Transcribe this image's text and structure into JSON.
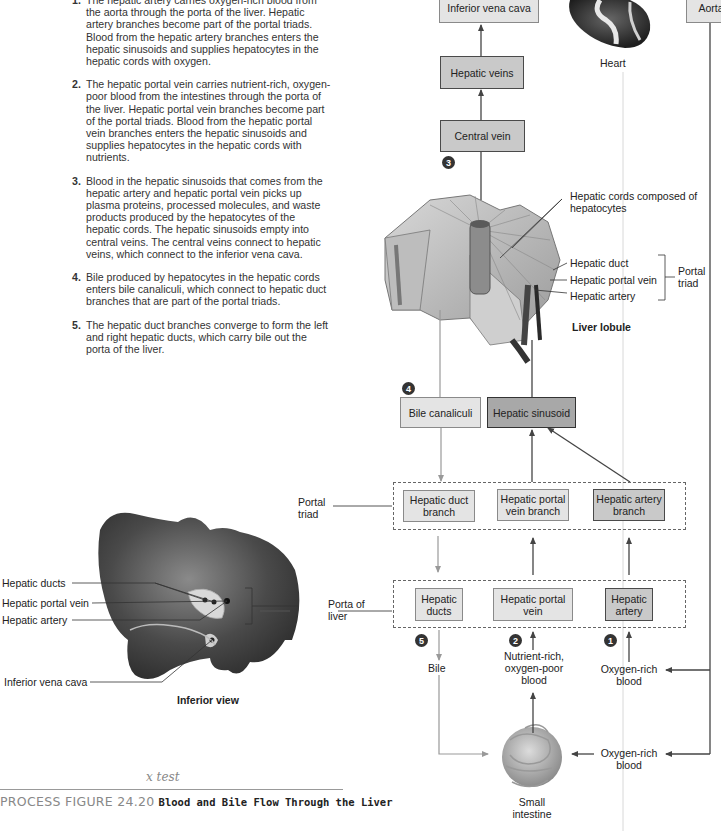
{
  "steps": [
    {
      "num": "1.",
      "text": "The hepatic artery carries oxygen-rich blood from the aorta through the porta of the liver. Hepatic artery branches become part of the portal triads. Blood from the hepatic artery branches enters the hepatic sinusoids and supplies hepatocytes in the hepatic cords with oxygen."
    },
    {
      "num": "2.",
      "text": "The hepatic portal vein carries nutrient-rich, oxygen-poor blood from the intestines through the porta of the liver. Hepatic portal vein branches become part of the portal triads. Blood from the hepatic portal vein branches enters the hepatic sinusoids and supplies hepatocytes in the hepatic cords with nutrients."
    },
    {
      "num": "3.",
      "text": "Blood in the hepatic sinusoids that comes from the hepatic artery and hepatic portal vein picks up plasma proteins, processed molecules, and waste products produced by the hepatocytes of the hepatic cords. The hepatic sinusoids empty into central veins. The central veins connect to hepatic veins, which connect to the inferior vena cava."
    },
    {
      "num": "4.",
      "text": "Bile produced by hepatocytes in the hepatic cords enters bile canaliculi, which connect to hepatic duct branches that are part of the portal triads."
    },
    {
      "num": "5.",
      "text": "The hepatic duct branches converge to form the left and right hepatic ducts, which carry bile out the porta of the liver."
    }
  ],
  "boxes": {
    "inferior_vena_cava": "Inferior vena cava",
    "hepatic_veins": "Hepatic veins",
    "central_vein": "Central vein",
    "aorta": "Aorta",
    "bile_canaliculi": "Bile canaliculi",
    "hepatic_sinusoid": "Hepatic sinusoid",
    "hepatic_duct_branch": "Hepatic duct branch",
    "hepatic_portal_vein_branch": "Hepatic portal vein branch",
    "hepatic_artery_branch": "Hepatic artery branch",
    "hepatic_ducts": "Hepatic ducts",
    "hepatic_portal_vein": "Hepatic portal vein",
    "hepatic_artery": "Hepatic artery"
  },
  "badges": {
    "b1": "1",
    "b2": "2",
    "b3": "3",
    "b4": "4",
    "b5": "5"
  },
  "labels": {
    "heart": "Heart",
    "hepatic_cords": "Hepatic cords composed of hepatocytes",
    "lobule_hepatic_duct": "Hepatic duct",
    "lobule_hepatic_portal_vein": "Hepatic portal vein",
    "lobule_hepatic_artery": "Hepatic artery",
    "portal_triad_bracket": "Portal triad",
    "liver_lobule": "Liver lobule",
    "portal_triad_group": "Portal triad",
    "porta_of_liver": "Porta of liver",
    "bile": "Bile",
    "nutrient_rich": "Nutrient-rich, oxygen-poor blood",
    "oxygen_rich_1": "Oxygen-rich blood",
    "oxygen_rich_2": "Oxygen-rich blood",
    "small_intestine": "Small intestine",
    "liver_hepatic_ducts": "Hepatic ducts",
    "liver_hepatic_portal_vein": "Hepatic portal vein",
    "liver_hepatic_artery": "Hepatic artery",
    "liver_inferior_vena_cava": "Inferior vena cava",
    "inferior_view": "Inferior view"
  },
  "caption": {
    "figure_id": "PROCESS FIGURE 24.20",
    "title": "Blood and Bile Flow Through the Liver",
    "handwritten_note": "x test"
  }
}
